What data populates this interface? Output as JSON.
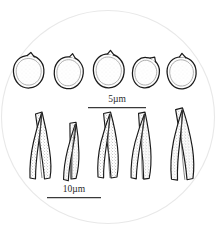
{
  "figure": {
    "kind": "microscopy-line-drawing",
    "background_color": "#ffffff",
    "field_circle": {
      "name": "microscope-field-circle",
      "center_x": 108,
      "center_y": 117,
      "radius": 107,
      "stroke_color": "#e6e6e6",
      "fill_color": "#ffffff"
    },
    "ink_color": "#1a1a1a",
    "stipple_color": "#6e6e6e"
  },
  "rows": [
    {
      "name": "spore-row",
      "label": "spores",
      "count": 5,
      "specimens": [
        {
          "id": "spore-1",
          "cx": 29,
          "cy": 72,
          "rx": 15,
          "ry": 16,
          "rotate": -4,
          "apiculus": "top-right"
        },
        {
          "id": "spore-2",
          "cx": 69,
          "cy": 73,
          "rx": 14,
          "ry": 16,
          "rotate": 6,
          "apiculus": "top"
        },
        {
          "id": "spore-3",
          "cx": 109,
          "cy": 71,
          "rx": 15,
          "ry": 17,
          "rotate": -2,
          "apiculus": "top"
        },
        {
          "id": "spore-4",
          "cx": 146,
          "cy": 73,
          "rx": 13,
          "ry": 15,
          "rotate": 10,
          "apiculus": "top-right"
        },
        {
          "id": "spore-5",
          "cx": 182,
          "cy": 73,
          "rx": 14,
          "ry": 16,
          "rotate": -6,
          "apiculus": "top"
        }
      ]
    },
    {
      "name": "cystidia-row",
      "label": "cystidia",
      "count": 5,
      "specimens": [
        {
          "id": "cystidium-1",
          "x": 38,
          "y": 112,
          "height": 68,
          "width": 22,
          "lean": -6
        },
        {
          "id": "cystidium-2",
          "x": 73,
          "y": 122,
          "height": 62,
          "width": 20,
          "lean": 4
        },
        {
          "id": "cystidium-3",
          "x": 106,
          "y": 112,
          "height": 66,
          "width": 22,
          "lean": 0
        },
        {
          "id": "cystidium-4",
          "x": 141,
          "y": 112,
          "height": 68,
          "width": 22,
          "lean": 2
        },
        {
          "id": "cystidium-5",
          "x": 178,
          "y": 108,
          "height": 72,
          "width": 24,
          "lean": -2
        }
      ]
    }
  ],
  "scale_bars": [
    {
      "name": "scale-bar-5um",
      "label": "5µm",
      "value": 5,
      "unit": "µm",
      "bar_x1": 88,
      "bar_x2": 146,
      "bar_y": 107,
      "label_x": 117,
      "label_y": 102,
      "stroke_color": "#3a3a3a"
    },
    {
      "name": "scale-bar-10um",
      "label": "10µm",
      "value": 10,
      "unit": "µm",
      "bar_x1": 47,
      "bar_x2": 101,
      "bar_y": 197,
      "label_x": 74,
      "label_y": 192,
      "stroke_color": "#3a3a3a"
    }
  ]
}
